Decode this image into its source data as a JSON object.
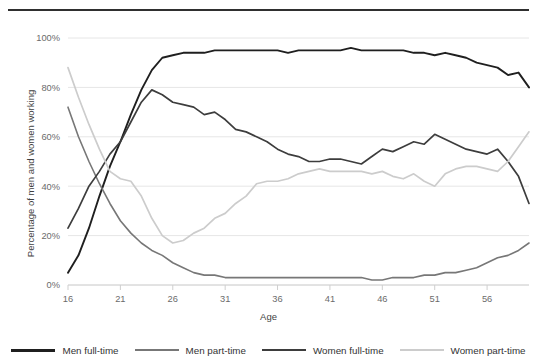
{
  "figure": {
    "has_top_rule": true
  },
  "axes": {
    "ylabel": "Percentage of men and women working",
    "xlabel": "Age",
    "yticks": [
      "0%",
      "20%",
      "40%",
      "60%",
      "80%",
      "100%"
    ],
    "xticks": [
      "16",
      "21",
      "26",
      "31",
      "36",
      "41",
      "46",
      "51",
      "56"
    ]
  },
  "legend": {
    "items": [
      {
        "label": "Men full-time",
        "color": "#1f1f1f"
      },
      {
        "label": "Men part-time",
        "color": "#777777"
      },
      {
        "label": "Women full-time",
        "color": "#3d3d3d"
      },
      {
        "label": "Women part-time",
        "color": "#cccccc"
      }
    ]
  },
  "chart_data": {
    "type": "line",
    "xlabel": "Age",
    "ylabel": "Percentage of men and women working",
    "xlim": [
      16,
      60
    ],
    "ylim": [
      0,
      100
    ],
    "yticks": [
      0,
      20,
      40,
      60,
      80,
      100
    ],
    "xticks": [
      16,
      21,
      26,
      31,
      36,
      41,
      46,
      51,
      56
    ],
    "grid": "horizontal",
    "legend_position": "bottom",
    "x": [
      16,
      17,
      18,
      19,
      20,
      21,
      22,
      23,
      24,
      25,
      26,
      27,
      28,
      29,
      30,
      31,
      32,
      33,
      34,
      35,
      36,
      37,
      38,
      39,
      40,
      41,
      42,
      43,
      44,
      45,
      46,
      47,
      48,
      49,
      50,
      51,
      52,
      53,
      54,
      55,
      56,
      57,
      58,
      59,
      60
    ],
    "series": [
      {
        "name": "Men full-time",
        "color": "#1f1f1f",
        "values": [
          5,
          12,
          23,
          36,
          48,
          58,
          69,
          79,
          87,
          92,
          93,
          94,
          94,
          94,
          95,
          95,
          95,
          95,
          95,
          95,
          95,
          94,
          95,
          95,
          95,
          95,
          95,
          96,
          95,
          95,
          95,
          95,
          95,
          94,
          94,
          93,
          94,
          93,
          92,
          90,
          89,
          88,
          85,
          86,
          80
        ]
      },
      {
        "name": "Men part-time",
        "color": "#777777",
        "values": [
          72,
          60,
          50,
          41,
          33,
          26,
          21,
          17,
          14,
          12,
          9,
          7,
          5,
          4,
          4,
          3,
          3,
          3,
          3,
          3,
          3,
          3,
          3,
          3,
          3,
          3,
          3,
          3,
          3,
          2,
          2,
          3,
          3,
          3,
          4,
          4,
          5,
          5,
          6,
          7,
          9,
          11,
          12,
          14,
          17
        ]
      },
      {
        "name": "Women full-time",
        "color": "#3d3d3d",
        "values": [
          23,
          31,
          40,
          46,
          53,
          58,
          66,
          74,
          79,
          77,
          74,
          73,
          72,
          69,
          70,
          67,
          63,
          62,
          60,
          58,
          55,
          53,
          52,
          50,
          50,
          51,
          51,
          50,
          49,
          52,
          55,
          54,
          56,
          58,
          57,
          61,
          59,
          57,
          55,
          54,
          53,
          55,
          50,
          44,
          33
        ]
      },
      {
        "name": "Women part-time",
        "color": "#cccccc",
        "values": [
          88,
          76,
          65,
          55,
          46,
          43,
          42,
          36,
          27,
          20,
          17,
          18,
          21,
          23,
          27,
          29,
          33,
          36,
          41,
          42,
          42,
          43,
          45,
          46,
          47,
          46,
          46,
          46,
          46,
          45,
          46,
          44,
          43,
          45,
          42,
          40,
          45,
          47,
          48,
          48,
          47,
          46,
          50,
          56,
          62
        ]
      }
    ]
  }
}
